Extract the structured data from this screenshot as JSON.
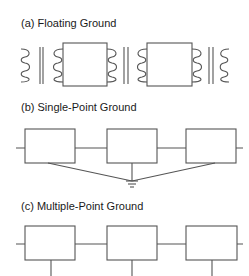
{
  "panels": [
    {
      "id": "a",
      "title": "(a) Floating Ground",
      "components": [
        "transformer",
        "box",
        "transformer",
        "box",
        "transformer"
      ]
    },
    {
      "id": "b",
      "title": "(b) Single-Point Ground",
      "components": [
        "box",
        "box",
        "box"
      ],
      "grounding": "single ground symbol shared by all boxes"
    },
    {
      "id": "c",
      "title": "(c) Multiple-Point Ground",
      "components": [
        "box",
        "box",
        "box"
      ],
      "grounding": "individual ground lead from each box"
    }
  ],
  "colors": {
    "line": "#555555",
    "text": "#1a1a1a",
    "background": "#ffffff"
  }
}
